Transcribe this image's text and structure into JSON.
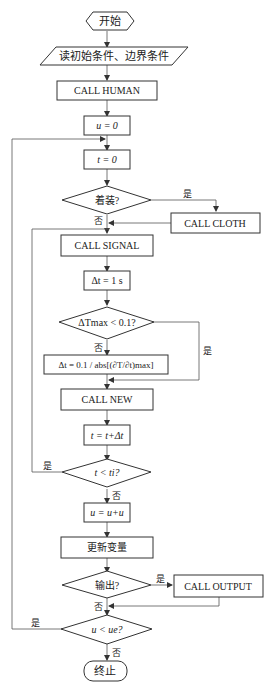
{
  "diagram": {
    "type": "flowchart",
    "nodes": {
      "start": "开始",
      "read": "读初始条件、边界条件",
      "human": "CALL HUMAN",
      "u0": "u = 0",
      "t0": "t = 0",
      "dressed": "着装?",
      "cloth": "CALL CLOTH",
      "signal": "CALL SIGNAL",
      "dt1": "Δt = 1 s",
      "tmax_check": "ΔTmax < 0.1?",
      "dt_calc": "Δt = 0.1 / abs[(∂T/∂t)max]",
      "new": "CALL NEW",
      "t_inc": "t = t+Δt",
      "t_check": "t < ti?",
      "u_inc": "u = u+u",
      "update": "更新变量",
      "output_check": "输出?",
      "output": "CALL OUTPUT",
      "u_check": "u < ue?",
      "end": "终止"
    },
    "labels": {
      "yes": "是",
      "no": "否"
    }
  }
}
